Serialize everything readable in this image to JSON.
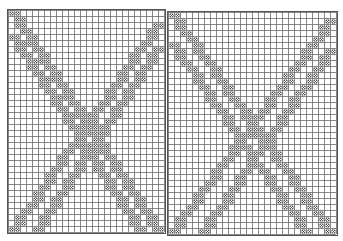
{
  "chart_data": {
    "type": "heatmap",
    "title": "",
    "cell_size_px": 6,
    "symbol": "×",
    "grid_color": "#6a6a6a",
    "mark_color": "#444444",
    "panels": [
      {
        "name": "left",
        "x": 8,
        "y": 10,
        "cols": 26,
        "rows": 37,
        "stripes": [
          {
            "dir": "down-right",
            "start_row": 0,
            "start_col": 0,
            "end_row": 36,
            "end_col": 24
          },
          {
            "dir": "down-right",
            "start_row": 4,
            "start_col": 0,
            "end_row": 36,
            "end_col": 21
          },
          {
            "dir": "down-left",
            "start_row": 2,
            "start_col": 24,
            "end_row": 36,
            "end_col": 0
          },
          {
            "dir": "down-left",
            "start_row": 6,
            "start_col": 24,
            "end_row": 36,
            "end_col": 4
          }
        ]
      },
      {
        "name": "right",
        "x": 168,
        "y": 12,
        "cols": 28,
        "rows": 37,
        "stripes": [
          {
            "dir": "down-right",
            "start_row": 0,
            "start_col": 0,
            "end_row": 36,
            "end_col": 26
          },
          {
            "dir": "down-right",
            "start_row": 5,
            "start_col": 0,
            "end_row": 36,
            "end_col": 22
          },
          {
            "dir": "down-left",
            "start_row": 1,
            "start_col": 26,
            "end_row": 36,
            "end_col": 0
          },
          {
            "dir": "down-left",
            "start_row": 6,
            "start_col": 26,
            "end_row": 36,
            "end_col": 5
          }
        ]
      }
    ]
  }
}
